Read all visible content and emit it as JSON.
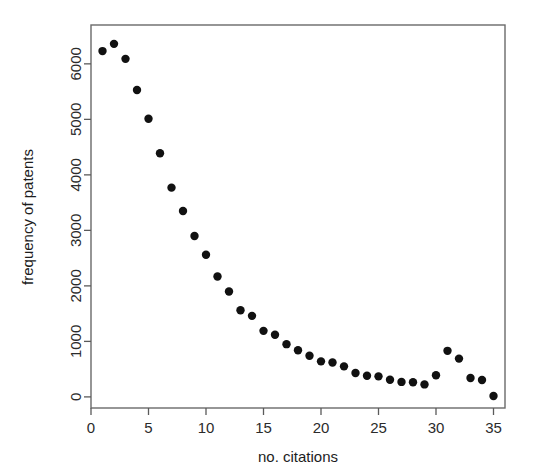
{
  "figure": {
    "width": 536,
    "height": 476,
    "background": "#ffffff",
    "point_color": "#111111",
    "axis_color": "#5a5a5a"
  },
  "chart_data": {
    "type": "scatter",
    "title": "",
    "xlabel": "no. citations",
    "ylabel": "frequency of patents",
    "xlim": [
      0,
      36
    ],
    "ylim": [
      -200,
      6700
    ],
    "xticks": [
      0,
      5,
      10,
      15,
      20,
      25,
      30,
      35
    ],
    "xtick_labels": [
      "0",
      "5",
      "10",
      "15",
      "20",
      "25",
      "30",
      "35"
    ],
    "yticks": [
      0,
      1000,
      2000,
      3000,
      4000,
      5000,
      6000
    ],
    "ytick_labels": [
      "0",
      "1000",
      "2000",
      "3000",
      "4000",
      "5000",
      "6000"
    ],
    "grid": false,
    "legend": null,
    "marker": "filled-circle",
    "marker_size": 4.2,
    "x": [
      1,
      2,
      3,
      4,
      5,
      6,
      7,
      8,
      9,
      10,
      11,
      12,
      13,
      14,
      15,
      16,
      17,
      18,
      19,
      20,
      21,
      22,
      23,
      24,
      25,
      26,
      27,
      28,
      29,
      30,
      31,
      32,
      33,
      34,
      35
    ],
    "y": [
      6230,
      6360,
      6090,
      5530,
      5010,
      4390,
      3770,
      3350,
      2900,
      2560,
      2170,
      1900,
      1560,
      1460,
      1190,
      1120,
      950,
      840,
      740,
      640,
      620,
      550,
      430,
      380,
      370,
      310,
      270,
      265,
      225,
      390,
      830,
      690,
      340,
      305,
      15
    ]
  }
}
